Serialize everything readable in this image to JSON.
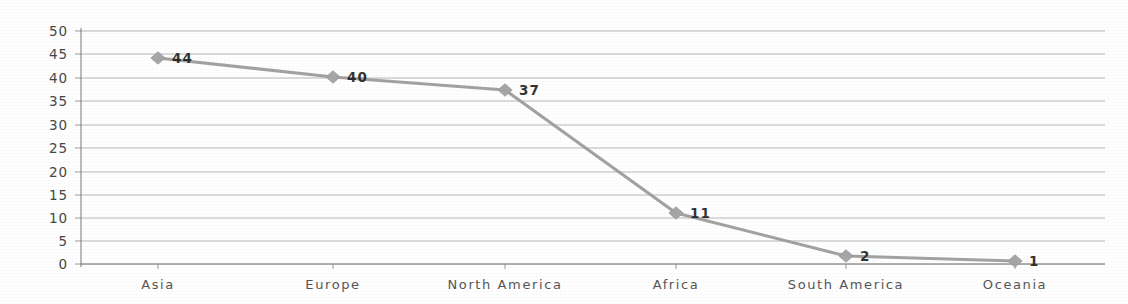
{
  "chart_data": {
    "type": "line",
    "title": "",
    "subtitle": "",
    "xlabel": "",
    "ylabel": "",
    "categories": [
      "Asia",
      "Europe",
      "North America",
      "Africa",
      "South America",
      "Oceania"
    ],
    "values": [
      44,
      40,
      37,
      11,
      2,
      1
    ],
    "point_labels": [
      "44",
      "40",
      "37",
      "11",
      "2",
      "1"
    ],
    "ylim": [
      0,
      50
    ],
    "ytick_step": 5,
    "ytick_labels": [
      "50",
      "45",
      "40",
      "35",
      "30",
      "25",
      "20",
      "15",
      "10",
      "5",
      "0"
    ],
    "grid": true,
    "legend": "none",
    "series": [
      {
        "name": "Series 1",
        "values": [
          44,
          40,
          37,
          11,
          2,
          1
        ]
      }
    ],
    "colors": {
      "line": "#9d9d9d",
      "marker": "#a6a6a6",
      "gridline": "#8e8e8e",
      "axis": "#6f6f6f",
      "label_text": "#1e1e1e",
      "tick_text": "#3a3a3a",
      "background": "#ffffff"
    }
  },
  "plot_geometry": {
    "left": 81,
    "right": 1105,
    "top": 31,
    "bottom": 264,
    "point_x": [
      158,
      333,
      505,
      676,
      846,
      1015
    ],
    "point_y": [
      58,
      77,
      90,
      213,
      256,
      261
    ],
    "label_offset_x": 14,
    "label_offset_y": 5,
    "xtick_label_y": 289,
    "ytick_label_x": 68,
    "ytick_y": [
      31,
      54,
      78,
      101,
      125,
      148,
      172,
      195,
      218,
      241,
      264
    ]
  }
}
